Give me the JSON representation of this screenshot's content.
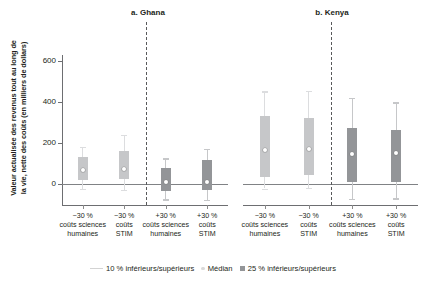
{
  "figure": {
    "ylabel": "Valeur actualisée des revenus tout au long de la vie, nette des coûts (en milliers de dollars)",
    "ylabel_line1": "Valeur actualisée des revenus tout au long de",
    "ylabel_line2": "la vie, nette des coûts (en milliers de dollars)"
  },
  "legend": {
    "whisker_label": "10 % inférieurs/supérieurs",
    "median_label": "Médian",
    "box_label": "25 % inférieurs/supérieurs"
  },
  "colors": {
    "box_light": "#c6c7c9",
    "box_dark": "#939598",
    "whisker_light": "#dcdddf",
    "whisker_dark": "#c6c7c9",
    "axis": "#6d6e71",
    "zero_line": "#808285",
    "divider": "#58595b",
    "text": "#231f20"
  },
  "chart_data": {
    "type": "box",
    "title": "",
    "xlabel": "",
    "ylabel": "Valeur actualisée des revenus tout au long de la vie, nette des coûts (en milliers de dollars)",
    "ylim": [
      -110,
      640
    ],
    "yticks": [
      0,
      200,
      400,
      600
    ],
    "ytick_labels": [
      "0",
      "200",
      "400",
      "600"
    ],
    "grid": false,
    "legend_position": "bottom",
    "panels": [
      {
        "key": "ghana",
        "title": "a. Ghana",
        "categories": [
          "−30 % coûts sciences humaines",
          "−30 % coûts STIM",
          "+30 % coûts sciences humaines",
          "+30 % coûts STIM"
        ],
        "category_lines": [
          [
            "−30 %",
            "coûts sciences",
            "humaines"
          ],
          [
            "−30 %",
            "coûts",
            "STIM"
          ],
          [
            "+30 %",
            "coûts sciences",
            "humaines"
          ],
          [
            "+30 %",
            "coûts",
            "STIM"
          ]
        ],
        "boxes": [
          {
            "label": "−30 % coûts sciences humaines",
            "p10": -25,
            "p25": 18,
            "median": 68,
            "p75": 130,
            "p90": 182,
            "shade": "light"
          },
          {
            "label": "−30 % coûts STIM",
            "p10": -28,
            "p25": 22,
            "median": 72,
            "p75": 162,
            "p90": 238,
            "shade": "light"
          },
          {
            "label": "+30 % coûts sciences humaines",
            "p10": -75,
            "p25": -32,
            "median": 8,
            "p75": 78,
            "p90": 125,
            "shade": "dark"
          },
          {
            "label": "+30 % coûts STIM",
            "p10": -78,
            "p25": -30,
            "median": 12,
            "p75": 118,
            "p90": 172,
            "shade": "dark"
          }
        ]
      },
      {
        "key": "kenya",
        "title": "b. Kenya",
        "categories": [
          "−30 % coûts sciences humaines",
          "−30 % coûts STIM",
          "+30 % coûts sciences humaines",
          "+30 % coûts STIM"
        ],
        "category_lines": [
          [
            "−30 %",
            "coûts sciences",
            "humaines"
          ],
          [
            "−30 %",
            "coûts",
            "STIM"
          ],
          [
            "+30 %",
            "coûts sciences",
            "humaines"
          ],
          [
            "+30 %",
            "coûts",
            "STIM"
          ]
        ],
        "boxes": [
          {
            "label": "−30 % coûts sciences humaines",
            "p10": -22,
            "p25": 35,
            "median": 168,
            "p75": 330,
            "p90": 452,
            "shade": "light"
          },
          {
            "label": "−30 % coûts STIM",
            "p10": -20,
            "p25": 42,
            "median": 172,
            "p75": 322,
            "p90": 455,
            "shade": "light"
          },
          {
            "label": "+30 % coûts sciences humaines",
            "p10": -72,
            "p25": 8,
            "median": 148,
            "p75": 272,
            "p90": 420,
            "shade": "dark"
          },
          {
            "label": "+30 % coûts STIM",
            "p10": -70,
            "p25": 12,
            "median": 152,
            "p75": 265,
            "p90": 398,
            "shade": "dark"
          }
        ]
      }
    ]
  }
}
